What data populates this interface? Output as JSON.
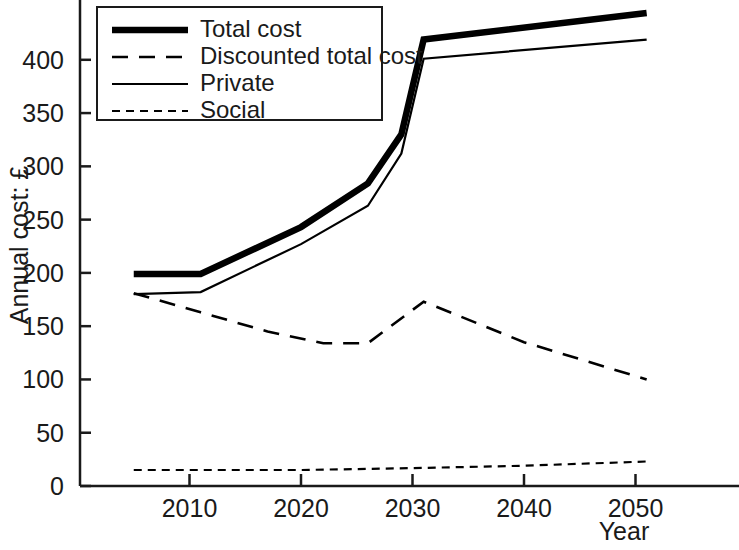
{
  "chart_data": {
    "type": "line",
    "title": "",
    "xlabel": "Year",
    "ylabel": "Annual cost: £",
    "xlim": [
      2005,
      2051
    ],
    "ylim": [
      0,
      455
    ],
    "grid": false,
    "legend_position": "top-left",
    "x_ticks": [
      2010,
      2020,
      2030,
      2040,
      2050
    ],
    "x_tick_labels": [
      "2010",
      "2020",
      "2030",
      "2040",
      "2050"
    ],
    "y_ticks": [
      0,
      50,
      100,
      150,
      200,
      250,
      300,
      350,
      400
    ],
    "y_tick_labels": [
      "0",
      "50",
      "100",
      "150",
      "200",
      "250",
      "300",
      "350",
      "400"
    ],
    "series": [
      {
        "name": "Total cost",
        "style": "thick-solid",
        "x": [
          2005,
          2011,
          2020,
          2026,
          2029,
          2031,
          2051
        ],
        "values": [
          199,
          199,
          243,
          284,
          330,
          419,
          444
        ]
      },
      {
        "name": "Discounted total cost",
        "style": "long-dashed",
        "x": [
          2005,
          2011,
          2017,
          2022,
          2026,
          2031,
          2040,
          2051
        ],
        "values": [
          181,
          163,
          145,
          134,
          134,
          173,
          135,
          100
        ]
      },
      {
        "name": "Private",
        "style": "thin-solid",
        "x": [
          2005,
          2011,
          2020,
          2026,
          2029,
          2031,
          2051
        ],
        "values": [
          180,
          182,
          227,
          263,
          312,
          401,
          419
        ]
      },
      {
        "name": "Social",
        "style": "short-dashed",
        "x": [
          2005,
          2020,
          2031,
          2040,
          2051
        ],
        "values": [
          15,
          15,
          17,
          19,
          23
        ]
      }
    ]
  },
  "legend": {
    "items": [
      {
        "label": "Total cost",
        "style": "thick-solid"
      },
      {
        "label": "Discounted total cost",
        "style": "long-dashed"
      },
      {
        "label": "Private",
        "style": "thin-solid"
      },
      {
        "label": "Social",
        "style": "short-dashed"
      }
    ]
  },
  "colors": {
    "ink": "#000000",
    "axis": "#1a1a1a",
    "background": "#ffffff"
  }
}
